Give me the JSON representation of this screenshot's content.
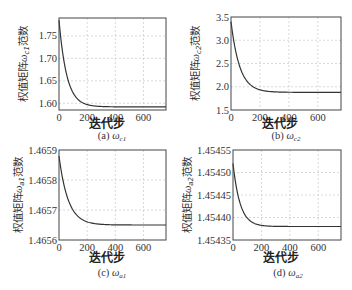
{
  "chart_data": [
    {
      "type": "line",
      "panel": "a",
      "caption_prefix": "(a)",
      "caption_symbol": "ω",
      "caption_sub": "c1",
      "xlabel": "迭代步",
      "ylabel_prefix": "权值矩阵",
      "ylabel_symbol": "ω",
      "ylabel_sub": "c1",
      "ylabel_suffix": "范数",
      "xlim": [
        0,
        760
      ],
      "ylim": [
        1.585,
        1.79
      ],
      "xticks": [
        0,
        200,
        400,
        600
      ],
      "xtick_labels": [
        "0",
        "200",
        "400",
        "600"
      ],
      "yticks": [
        1.6,
        1.65,
        1.7,
        1.75
      ],
      "ytick_labels": [
        "1.60",
        "1.65",
        "1.70",
        "1.75"
      ],
      "grid": true,
      "start": 1.785,
      "end": 1.592,
      "tau": 55,
      "x": [
        0,
        25,
        50,
        100,
        150,
        200,
        300,
        400,
        600,
        760
      ],
      "y": [
        1.785,
        1.72,
        1.675,
        1.628,
        1.608,
        1.599,
        1.593,
        1.592,
        1.592,
        1.592
      ]
    },
    {
      "type": "line",
      "panel": "b",
      "caption_prefix": "(b)",
      "caption_symbol": "ω",
      "caption_sub": "c2",
      "xlabel": "迭代步",
      "ylabel_prefix": "权值矩阵",
      "ylabel_symbol": "ω",
      "ylabel_sub": "c2",
      "ylabel_suffix": "范数",
      "xlim": [
        0,
        760
      ],
      "ylim": [
        1.5,
        3.5
      ],
      "xticks": [
        0,
        200,
        400,
        600
      ],
      "xtick_labels": [
        "0",
        "200",
        "400",
        "600"
      ],
      "yticks": [
        1.5,
        2.0,
        2.5,
        3.0,
        3.5
      ],
      "ytick_labels": [
        "1.5",
        "2.0",
        "2.5",
        "3.0",
        "3.5"
      ],
      "grid": true,
      "start": 3.4,
      "end": 1.88,
      "tau": 60,
      "x": [
        0,
        25,
        50,
        100,
        150,
        200,
        300,
        400,
        600,
        760
      ],
      "y": [
        3.4,
        2.9,
        2.55,
        2.17,
        2.0,
        1.94,
        1.89,
        1.88,
        1.88,
        1.88
      ]
    },
    {
      "type": "line",
      "panel": "c",
      "caption_prefix": "(c)",
      "caption_symbol": "ω",
      "caption_sub": "a1",
      "xlabel": "迭代步",
      "ylabel_prefix": "权值矩阵",
      "ylabel_symbol": "ω",
      "ylabel_sub": "a1",
      "ylabel_suffix": "范数",
      "xlim": [
        0,
        760
      ],
      "ylim": [
        1.4656,
        1.4659
      ],
      "xticks": [
        0,
        200,
        400,
        600
      ],
      "xtick_labels": [
        "0",
        "200",
        "400",
        "600"
      ],
      "yticks": [
        1.4656,
        1.4657,
        1.4658,
        1.4659
      ],
      "ytick_labels": [
        "1.4656",
        "1.4657",
        "1.4658",
        "1.4659"
      ],
      "grid": true,
      "start": 1.46588,
      "end": 1.46565,
      "tau": 65,
      "x": [
        0,
        25,
        50,
        100,
        150,
        200,
        300,
        400,
        600,
        760
      ],
      "y": [
        1.46588,
        1.46581,
        1.46576,
        1.4657,
        1.46567,
        1.46566,
        1.46565,
        1.46565,
        1.46565,
        1.46565
      ]
    },
    {
      "type": "line",
      "panel": "d",
      "caption_prefix": "(d)",
      "caption_symbol": "ω",
      "caption_sub": "a2",
      "xlabel": "迭代步",
      "ylabel_prefix": "权值矩阵",
      "ylabel_symbol": "ω",
      "ylabel_sub": "a2",
      "ylabel_suffix": "范数",
      "xlim": [
        0,
        760
      ],
      "ylim": [
        1.45435,
        1.45455
      ],
      "xticks": [
        0,
        200,
        400,
        600
      ],
      "xtick_labels": [
        "0",
        "200",
        "400",
        "600"
      ],
      "yticks": [
        1.45435,
        1.4544,
        1.45445,
        1.4545,
        1.45455
      ],
      "ytick_labels": [
        "1.45435",
        "1.45440",
        "1.45445",
        "1.45450",
        "1.45455"
      ],
      "grid": true,
      "start": 1.45452,
      "end": 1.45438,
      "tau": 50,
      "x": [
        0,
        25,
        50,
        100,
        150,
        200,
        300,
        400,
        600,
        760
      ],
      "y": [
        1.45452,
        1.45446,
        1.45443,
        1.4544,
        1.45439,
        1.45438,
        1.45438,
        1.45438,
        1.45438,
        1.45438
      ]
    }
  ]
}
